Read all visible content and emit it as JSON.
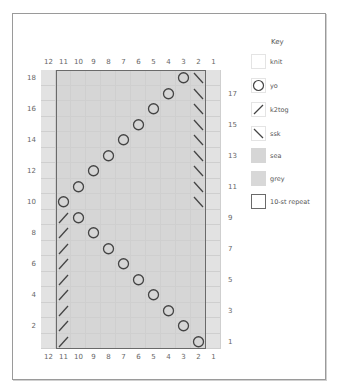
{
  "chart": {
    "columns": 12,
    "rows": 18,
    "top_col_labels": [
      "12",
      "11",
      "10",
      "9",
      "8",
      "7",
      "6",
      "5",
      "4",
      "3",
      "2",
      "1"
    ],
    "bottom_col_labels": [
      "12",
      "11",
      "10",
      "9",
      "8",
      "7",
      "6",
      "5",
      "4",
      "3",
      "2",
      "1"
    ],
    "left_row_labels": [
      "18",
      "16",
      "14",
      "12",
      "10",
      "8",
      "6",
      "4",
      "2"
    ],
    "right_row_labels": [
      "17",
      "15",
      "13",
      "11",
      "9",
      "7",
      "5",
      "3",
      "1"
    ],
    "repeat": {
      "from_col": 11,
      "to_col": 2,
      "label": "10-st repeat"
    },
    "stitches": [
      {
        "row": 1,
        "yo": 2,
        "k2tog": 11
      },
      {
        "row": 2,
        "yo": 3,
        "k2tog": 11
      },
      {
        "row": 3,
        "yo": 4,
        "k2tog": 11
      },
      {
        "row": 4,
        "yo": 5,
        "k2tog": 11
      },
      {
        "row": 5,
        "yo": 6,
        "k2tog": 11
      },
      {
        "row": 6,
        "yo": 7,
        "k2tog": 11
      },
      {
        "row": 7,
        "yo": 8,
        "k2tog": 11
      },
      {
        "row": 8,
        "yo": 9,
        "k2tog": 11
      },
      {
        "row": 9,
        "yo": 10,
        "k2tog": 11
      },
      {
        "row": 10,
        "yo": 11,
        "ssk": 2
      },
      {
        "row": 11,
        "yo": 10,
        "ssk": 2
      },
      {
        "row": 12,
        "yo": 9,
        "ssk": 2
      },
      {
        "row": 13,
        "yo": 8,
        "ssk": 2
      },
      {
        "row": 14,
        "yo": 7,
        "ssk": 2
      },
      {
        "row": 15,
        "yo": 6,
        "ssk": 2
      },
      {
        "row": 16,
        "yo": 5,
        "ssk": 2
      },
      {
        "row": 17,
        "yo": 4,
        "ssk": 2
      },
      {
        "row": 18,
        "yo": 3,
        "ssk": 2
      }
    ],
    "colors": {
      "sea": "#d6d6d6",
      "grey": "#e2e2e2",
      "gridline": "#cfcfcf",
      "symbol": "#444444",
      "repeat_border": "#6a6a6a"
    }
  },
  "key": {
    "title": "Key",
    "items": [
      {
        "symbol": "knit",
        "label": "knit"
      },
      {
        "symbol": "yo",
        "label": "yo"
      },
      {
        "symbol": "k2tog",
        "label": "k2tog"
      },
      {
        "symbol": "ssk",
        "label": "ssk"
      },
      {
        "symbol": "sea",
        "label": "sea"
      },
      {
        "symbol": "grey",
        "label": "grey"
      },
      {
        "symbol": "repeat",
        "label": "10-st repeat"
      }
    ]
  }
}
